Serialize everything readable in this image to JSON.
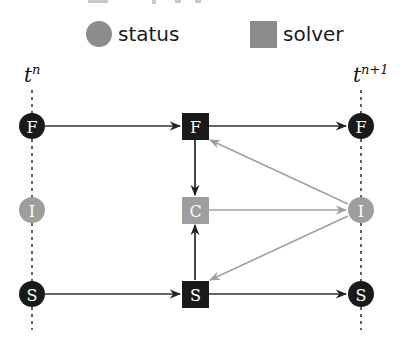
{
  "legend": {
    "items": [
      {
        "shape": "circle",
        "label": "status",
        "color": "#8c8c8c"
      },
      {
        "shape": "square",
        "label": "solver",
        "color": "#8c8c8c"
      }
    ]
  },
  "time_labels": {
    "left": {
      "base": "t",
      "sup": "n"
    },
    "right": {
      "base": "t",
      "sup": "n+1"
    }
  },
  "nodes": {
    "left_F": {
      "label": "F",
      "type": "status",
      "color": "#1a1a1a"
    },
    "left_I": {
      "label": "I",
      "type": "status",
      "color": "#9e9e9e"
    },
    "left_S": {
      "label": "S",
      "type": "status",
      "color": "#1a1a1a"
    },
    "mid_F": {
      "label": "F",
      "type": "solver",
      "color": "#1a1a1a"
    },
    "mid_C": {
      "label": "C",
      "type": "solver",
      "color": "#9e9e9e"
    },
    "mid_S": {
      "label": "S",
      "type": "solver",
      "color": "#1a1a1a"
    },
    "right_F": {
      "label": "F",
      "type": "status",
      "color": "#1a1a1a"
    },
    "right_I": {
      "label": "I",
      "type": "status",
      "color": "#9e9e9e"
    },
    "right_S": {
      "label": "S",
      "type": "status",
      "color": "#1a1a1a"
    }
  },
  "edges": [
    {
      "from": "left_F",
      "to": "mid_F",
      "color": "#333333"
    },
    {
      "from": "mid_F",
      "to": "right_F",
      "color": "#333333"
    },
    {
      "from": "left_S",
      "to": "mid_S",
      "color": "#333333"
    },
    {
      "from": "mid_S",
      "to": "right_S",
      "color": "#333333"
    },
    {
      "from": "mid_F",
      "to": "mid_C",
      "color": "#1a1a1a"
    },
    {
      "from": "mid_S",
      "to": "mid_C",
      "color": "#1a1a1a"
    },
    {
      "from": "mid_C",
      "to": "right_I",
      "color": "#a0a0a0"
    },
    {
      "from": "right_I",
      "to": "mid_F",
      "color": "#a0a0a0"
    },
    {
      "from": "right_I",
      "to": "mid_S",
      "color": "#a0a0a0"
    }
  ],
  "colors": {
    "dark": "#1a1a1a",
    "light": "#9e9e9e",
    "edge_dark": "#333333",
    "edge_light": "#a0a0a0"
  }
}
